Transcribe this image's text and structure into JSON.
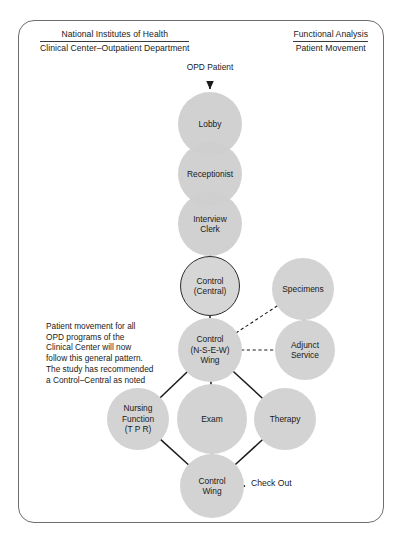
{
  "document": {
    "title": "National Institutes of Health – Functional Analysis / Patient Movement flow diagram"
  },
  "header": {
    "left": {
      "line1": "National Institutes of Health",
      "line2": "Clinical Center–Outpatient Department"
    },
    "right": {
      "line1": "Functional Analysis",
      "line2": "Patient Movement"
    }
  },
  "entry": {
    "label": "OPD\nPatient"
  },
  "exit": {
    "label": "Check Out"
  },
  "note": {
    "text": "Patient movement for all\nOPD programs of the\nClinical Center will now\nfollow this general pattern.\nThe study has recommended\na Control–Central as noted"
  },
  "chart_data": {
    "type": "diagram",
    "nodes": [
      {
        "id": "lobby",
        "label": "Lobby",
        "cx": 210,
        "cy": 124,
        "r": 32,
        "style": "stacked"
      },
      {
        "id": "receptionist",
        "label": "Receptionist",
        "cx": 210,
        "cy": 174,
        "r": 32,
        "style": "stacked"
      },
      {
        "id": "interview",
        "label": "Interview\nClerk",
        "cx": 210,
        "cy": 224,
        "r": 32,
        "style": "stacked"
      },
      {
        "id": "control_central",
        "label": "Control\n(Central)",
        "cx": 210,
        "cy": 286,
        "r": 30,
        "style": "outlined"
      },
      {
        "id": "specimens",
        "label": "Specimens",
        "cx": 303,
        "cy": 289,
        "r": 31,
        "style": "plain"
      },
      {
        "id": "control_wing_nsew",
        "label": "Control\n(N-S-E-W)\nWing",
        "cx": 210,
        "cy": 350,
        "r": 32,
        "style": "plain"
      },
      {
        "id": "adjunct",
        "label": "Adjunct\nService",
        "cx": 305,
        "cy": 350,
        "r": 30,
        "style": "plain"
      },
      {
        "id": "nursing",
        "label": "Nursing\nFunction\n(T P R)",
        "cx": 138,
        "cy": 419,
        "r": 31,
        "style": "plain"
      },
      {
        "id": "exam",
        "label": "Exam",
        "cx": 212,
        "cy": 419,
        "r": 35,
        "style": "plain"
      },
      {
        "id": "therapy",
        "label": "Therapy",
        "cx": 285,
        "cy": 419,
        "r": 31,
        "style": "plain"
      },
      {
        "id": "control_wing",
        "label": "Control\nWing",
        "cx": 212,
        "cy": 486,
        "r": 32,
        "style": "plain"
      }
    ],
    "edges": [
      {
        "from": "entry",
        "to": "lobby",
        "style": "solid",
        "arrow": true
      },
      {
        "from": "interview",
        "to": "control_central",
        "style": "solid",
        "arrow": false
      },
      {
        "from": "control_central",
        "to": "control_wing_nsew",
        "style": "solid",
        "arrow": false
      },
      {
        "from": "control_wing_nsew",
        "to": "specimens",
        "style": "dashed",
        "arrow": false
      },
      {
        "from": "control_wing_nsew",
        "to": "adjunct",
        "style": "dashed",
        "arrow": false
      },
      {
        "from": "specimens",
        "to": "adjunct",
        "style": "dashed",
        "arrow": false
      },
      {
        "from": "control_wing_nsew",
        "to": "nursing",
        "style": "solid",
        "arrow": false
      },
      {
        "from": "control_wing_nsew",
        "to": "exam",
        "style": "solid",
        "arrow": false
      },
      {
        "from": "control_wing_nsew",
        "to": "therapy",
        "style": "solid",
        "arrow": false
      },
      {
        "from": "nursing",
        "to": "control_wing",
        "style": "solid",
        "arrow": false
      },
      {
        "from": "exam",
        "to": "control_wing",
        "style": "solid",
        "arrow": false
      },
      {
        "from": "therapy",
        "to": "control_wing",
        "style": "solid",
        "arrow": false
      },
      {
        "from": "control_wing",
        "to": "exit",
        "style": "solid",
        "arrow": true
      }
    ],
    "colors": {
      "node_fill": "#d3d3d3",
      "node_outline": "#2b2b2b",
      "connector": "#1a1a1a",
      "frame": "#6e6e6e",
      "background": "#ffffff"
    }
  }
}
